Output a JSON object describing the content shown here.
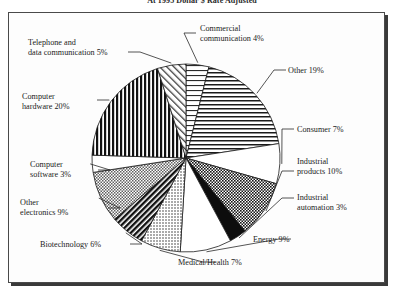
{
  "chart_title": "At 1995 Dollar $ Rate Adjusted",
  "frame": {
    "border_color": "#4a4a4a",
    "shadow_color": "#3a3a3a",
    "background": "#fdfdfd"
  },
  "chart_data": {
    "type": "pie",
    "title": "At 1995 Dollar $ Rate Adjusted",
    "xlabel": "",
    "ylabel": "",
    "units": "percent",
    "total": 102,
    "legend": "none",
    "labels_position": "external-with-leader-lines",
    "start_angle_deg": -90,
    "direction": "clockwise",
    "categories": [
      "Commercial communication",
      "Other",
      "Consumer",
      "Industrial products",
      "Industrial automation",
      "Energy",
      "Medical/Health",
      "Biotechnology",
      "Other electronics",
      "Computer software",
      "Computer hardware",
      "Telephone and data communication"
    ],
    "values": [
      4,
      19,
      7,
      10,
      3,
      9,
      7,
      6,
      9,
      3,
      20,
      5
    ],
    "slices": [
      {
        "label": "Commercial communication",
        "value": 4,
        "display": "Commercial communication 4%",
        "pattern": "horizontal-lines-sparse"
      },
      {
        "label": "Other",
        "value": 19,
        "display": "Other 19%",
        "pattern": "horizontal-lines"
      },
      {
        "label": "Consumer",
        "value": 7,
        "display": "Consumer 7%",
        "pattern": "solid-white"
      },
      {
        "label": "Industrial products",
        "value": 10,
        "display": "Industrial products 10%",
        "pattern": "checkerboard-dark"
      },
      {
        "label": "Industrial automation",
        "value": 3,
        "display": "Industrial automation 3%",
        "pattern": "solid-black"
      },
      {
        "label": "Energy",
        "value": 9,
        "display": "Energy 9%",
        "pattern": "solid-white"
      },
      {
        "label": "Medical/Health",
        "value": 7,
        "display": "Medical/Health 7%",
        "pattern": "dots-fine"
      },
      {
        "label": "Biotechnology",
        "value": 6,
        "display": "Biotechnology 6%",
        "pattern": "diagonal-hatch-dark"
      },
      {
        "label": "Other electronics",
        "value": 9,
        "display": "Other electronics 9%",
        "pattern": "checkerboard-mid"
      },
      {
        "label": "Computer software",
        "value": 3,
        "display": "Computer software 3%",
        "pattern": "solid-white"
      },
      {
        "label": "Computer hardware",
        "value": 20,
        "display": "Computer hardware 20%",
        "pattern": "vertical-stripes"
      },
      {
        "label": "Telephone and data communication",
        "value": 5,
        "display": "Telephone and data communication 5%",
        "pattern": "diagonal-hatch-light"
      }
    ]
  },
  "labels": {
    "telephone": {
      "line1": "Telephone and",
      "line2": "data communication 5%"
    },
    "commercial": {
      "line1": "Commercial",
      "line2": "communication 4%"
    },
    "other": {
      "line1": "Other 19%"
    },
    "consumer": {
      "line1": "Consumer 7%"
    },
    "industrial_products": {
      "line1": "Industrial",
      "line2": "products 10%"
    },
    "industrial_automation": {
      "line1": "Industrial",
      "line2": "automation 3%"
    },
    "energy": {
      "line1": "Energy 9%"
    },
    "medical": {
      "line1": "Medical/Health 7%"
    },
    "biotechnology": {
      "line1": "Biotechnology 6%"
    },
    "other_electronics": {
      "line1": "Other",
      "line2": "electronics 9%"
    },
    "computer_software": {
      "line1": "Computer",
      "line2": "software 3%"
    },
    "computer_hardware": {
      "line1": "Computer",
      "line2": "hardware 20%"
    }
  }
}
